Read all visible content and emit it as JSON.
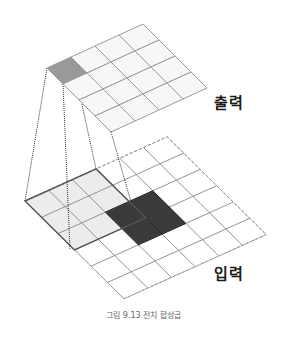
{
  "figure": {
    "caption": "그림 9.13 전치 합성곱",
    "output_label": "출력",
    "input_label": "입력"
  },
  "output_grid": {
    "rows": 4,
    "cols": 4,
    "origin": [
      47,
      68
    ],
    "row_vec": [
      24,
      -11
    ],
    "col_vec": [
      16,
      16
    ],
    "cell_fill": "#f7f7f7",
    "line_color": "#9a9a9a",
    "highlight_cells": [
      [
        0,
        0
      ]
    ],
    "highlight_fill": "#999999"
  },
  "input_grid": {
    "rows": 6,
    "cols": 6,
    "origin": [
      25,
      201
    ],
    "row_vec": [
      23.7,
      -10.7
    ],
    "col_vec": [
      16.5,
      16.3
    ],
    "line_color": "#888888",
    "light_region": {
      "i": [
        0,
        3
      ],
      "j": [
        0,
        3
      ],
      "fill": "#ececec",
      "border": "#555555"
    },
    "dark_region": {
      "i": [
        2,
        4
      ],
      "j": [
        2,
        4
      ],
      "fill": "#3a3a3a",
      "border": "#222222"
    }
  },
  "connectors": [
    {
      "from": [
        47,
        68
      ],
      "to": [
        25,
        201
      ]
    },
    {
      "from": [
        63,
        84
      ],
      "to": [
        70,
        250
      ]
    },
    {
      "from": [
        81,
        100
      ],
      "to": [
        96,
        169
      ]
    },
    {
      "from": [
        111,
        132
      ],
      "to": [
        131,
        202
      ]
    }
  ]
}
